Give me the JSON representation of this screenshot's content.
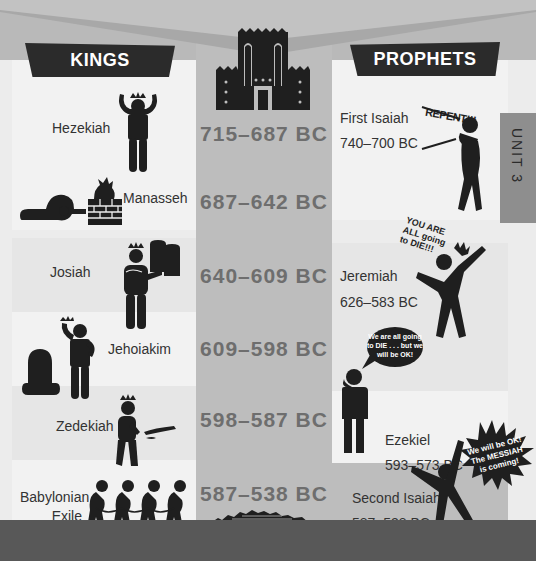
{
  "header": {
    "kings_label": "KINGS",
    "prophets_label": "PROPHETS",
    "unit_tab": "UNIT 3"
  },
  "kings": [
    {
      "name": "Hezekiah",
      "icon": "king-arms-raised-icon"
    },
    {
      "name": "Manasseh",
      "icon": "bowing-to-idol-icon"
    },
    {
      "name": "Josiah",
      "icon": "king-with-tablets-icon"
    },
    {
      "name": "Jehoiakim",
      "icon": "king-over-kneeling-figure-icon"
    },
    {
      "name": "Zedekiah",
      "icon": "king-broken-crown-icon"
    },
    {
      "name": "Babylonian",
      "name_line2": "Exile",
      "icon": "chained-captives-icon"
    }
  ],
  "timeline": {
    "top_icon": "temple-icon",
    "bottom_icon": "ruined-wall-icon",
    "dates": [
      "715–687 BC",
      "687–642 BC",
      "640–609 BC",
      "609–598 BC",
      "598–587 BC",
      "587–538 BC"
    ]
  },
  "prophets": [
    {
      "name": "First Isaiah",
      "dates": "740–700 BC",
      "speech": "REPENT!!!",
      "icon": "prophet-shouting-icon"
    },
    {
      "name": "Jeremiah",
      "dates": "626–583 BC",
      "speech": "YOU ARE ALL going to DIE!!!",
      "icon": "prophet-pointing-icon"
    },
    {
      "name": "Ezekiel",
      "dates": "593–573 BC",
      "speech": "We are all going to DIE . . . but we will be OK!",
      "icon": "prophet-thinking-icon"
    },
    {
      "name": "Second Isaiah",
      "dates": "587–538 BC",
      "speech": "We will be OK! The MESSIAH is coming!",
      "icon": "prophet-celebrating-icon"
    }
  ],
  "colors": {
    "dark": "#2b2b2b",
    "timeline_column": "#bdbdbd",
    "date_text": "#6e6e6e",
    "bottom_bar": "#585858",
    "unit_tab": "#8e8e8e"
  }
}
